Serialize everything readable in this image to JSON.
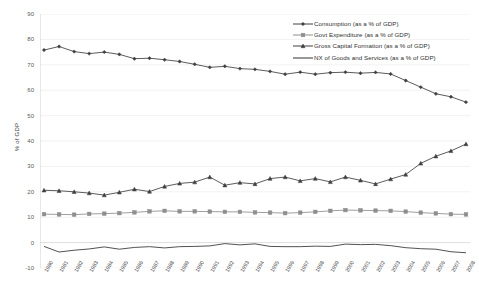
{
  "chart_data": {
    "type": "line",
    "title": "",
    "xlabel": "",
    "ylabel": "% of GDP",
    "ylim": [
      -10,
      90
    ],
    "ytick_step": 10,
    "yticks": [
      90,
      80,
      70,
      60,
      50,
      40,
      30,
      20,
      10,
      0,
      -10
    ],
    "grid": true,
    "legend_position": "top-right",
    "categories": [
      "1980",
      "1981",
      "1982",
      "1983",
      "1984",
      "1985",
      "1986",
      "1987",
      "1988",
      "1989",
      "1990",
      "1991",
      "1992",
      "1993",
      "1994",
      "1995",
      "1996",
      "1997",
      "1998",
      "1999",
      "2000",
      "2001",
      "2002",
      "2003",
      "2004",
      "2005",
      "2006",
      "2007",
      "2008"
    ],
    "series": [
      {
        "name": "Consumption (as a % of GDP)",
        "marker": "diamond",
        "color": "#3f3f3f",
        "values": [
          75.8,
          77.2,
          75.2,
          74.4,
          75.0,
          74.1,
          72.4,
          72.6,
          72.0,
          71.3,
          70.2,
          69.0,
          69.4,
          68.5,
          68.2,
          67.4,
          66.3,
          67.1,
          66.3,
          66.9,
          67.1,
          66.7,
          67.0,
          66.4,
          63.8,
          61.2,
          58.6,
          57.4,
          55.3
        ]
      },
      {
        "name": "Govt Expenditure (as a % of GDP)",
        "marker": "square",
        "color": "#8e8e8e",
        "values": [
          11.2,
          11.1,
          11.0,
          11.3,
          11.4,
          11.6,
          11.9,
          12.3,
          12.5,
          12.3,
          12.3,
          12.2,
          12.1,
          12.1,
          11.9,
          11.8,
          11.6,
          11.8,
          12.1,
          12.5,
          12.8,
          12.7,
          12.6,
          12.5,
          12.2,
          11.8,
          11.5,
          11.2,
          11.1
        ]
      },
      {
        "name": "Gross Capital Formation (as a % of GDP)",
        "marker": "triangle",
        "color": "#3f3f3f",
        "values": [
          20.6,
          20.4,
          20.0,
          19.5,
          18.7,
          19.8,
          21.0,
          20.1,
          22.1,
          23.3,
          23.8,
          25.8,
          22.6,
          23.6,
          23.1,
          25.2,
          25.8,
          24.3,
          25.2,
          23.9,
          25.8,
          24.5,
          23.1,
          25.0,
          26.8,
          31.2,
          34.0,
          36.1,
          38.8
        ]
      },
      {
        "name": "NX of Goods and Services (as a % of GDP)",
        "marker": "none",
        "color": "#333333",
        "values": [
          -1.5,
          -3.7,
          -3.0,
          -2.5,
          -1.7,
          -2.6,
          -1.9,
          -1.6,
          -2.1,
          -1.6,
          -1.5,
          -1.3,
          -0.4,
          -0.9,
          -0.5,
          -1.5,
          -1.6,
          -1.6,
          -1.4,
          -1.5,
          -0.6,
          -0.8,
          -0.7,
          -1.2,
          -2.0,
          -2.4,
          -2.6,
          -3.6,
          -4.0
        ]
      }
    ]
  },
  "caption": {
    "text": ""
  }
}
